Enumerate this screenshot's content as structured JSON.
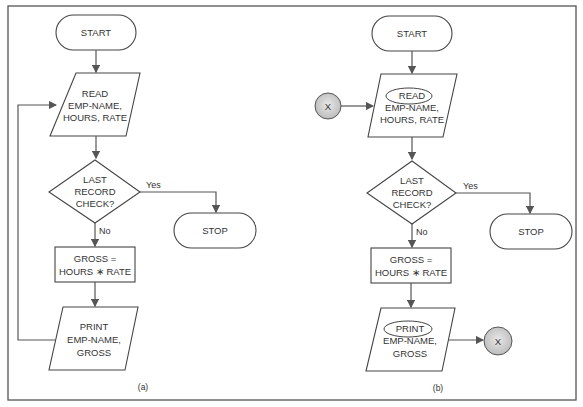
{
  "figure": {
    "panel_a": {
      "label": "(a)",
      "start": "START",
      "read": [
        "READ",
        "EMP-NAME,",
        "HOURS, RATE"
      ],
      "decision": [
        "LAST",
        "RECORD",
        "CHECK?"
      ],
      "yes": "Yes",
      "no": "No",
      "stop": "STOP",
      "process": [
        "GROSS =",
        "HOURS ∗ RATE"
      ],
      "print": [
        "PRINT",
        "EMP-NAME,",
        "GROSS"
      ]
    },
    "panel_b": {
      "label": "(b)",
      "start": "START",
      "connector_in": "X",
      "read": [
        "READ",
        "EMP-NAME,",
        "HOURS, RATE"
      ],
      "decision": [
        "LAST",
        "RECORD",
        "CHECK?"
      ],
      "yes": "Yes",
      "no": "No",
      "stop": "STOP",
      "process": [
        "GROSS =",
        "HOURS ∗ RATE"
      ],
      "print": [
        "PRINT",
        "EMP-NAME,",
        "GROSS"
      ],
      "connector_out": "X"
    }
  }
}
